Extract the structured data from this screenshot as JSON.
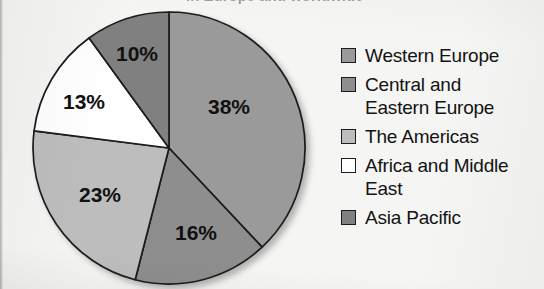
{
  "figure": {
    "title_cutoff": "in Europe and worldwide",
    "background_color": "#f5f5f3",
    "outline_color": "#1b1b1b"
  },
  "chart_data": {
    "type": "pie",
    "title": "",
    "xlabel": "",
    "ylabel": "",
    "units": "percent",
    "start_angle_deg": 0,
    "direction": "clockwise",
    "total": 100,
    "categories": [
      "Western Europe",
      "Central and Eastern Europe",
      "The Americas",
      "Africa and Middle East",
      "Asia Pacific"
    ],
    "values": [
      38,
      16,
      23,
      13,
      10
    ],
    "data_labels": [
      "38%",
      "16%",
      "23%",
      "13%",
      "10%"
    ],
    "colors": [
      "#9a9a9a",
      "#8e8e8e",
      "#bdbdbd",
      "#ffffff",
      "#808080"
    ],
    "legend_position": "right",
    "grid": false
  },
  "pie": {
    "center_x": 169,
    "center_y": 148,
    "radius": 136,
    "slices": [
      {
        "name": "Western Europe",
        "value": 38,
        "label": "38%",
        "color": "#9a9a9a",
        "label_x": 229,
        "label_y": 108
      },
      {
        "name": "Central and Eastern Europe",
        "value": 16,
        "label": "16%",
        "color": "#8e8e8e",
        "label_x": 196,
        "label_y": 234
      },
      {
        "name": "The Americas",
        "value": 23,
        "label": "23%",
        "color": "#bdbdbd",
        "label_x": 100,
        "label_y": 196
      },
      {
        "name": "Africa and Middle East",
        "value": 13,
        "label": "13%",
        "color": "#ffffff",
        "label_x": 84,
        "label_y": 103
      },
      {
        "name": "Asia Pacific",
        "value": 10,
        "label": "10%",
        "color": "#808080",
        "label_x": 137,
        "label_y": 55
      }
    ]
  },
  "legend": {
    "items": [
      {
        "label": "Western Europe",
        "color": "#9a9a9a"
      },
      {
        "label": "Central and\nEastern Europe",
        "color": "#8e8e8e"
      },
      {
        "label": "The Americas",
        "color": "#bdbdbd"
      },
      {
        "label": "Africa and Middle\nEast",
        "color": "#ffffff"
      },
      {
        "label": "Asia Pacific",
        "color": "#808080"
      }
    ]
  }
}
